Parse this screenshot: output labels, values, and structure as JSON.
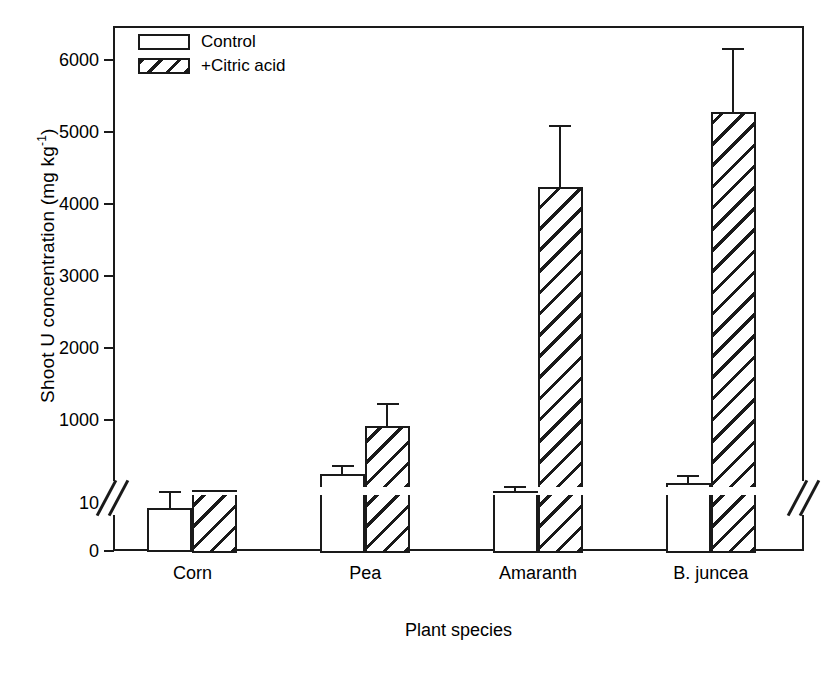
{
  "chart_data": {
    "type": "bar",
    "title": "",
    "xlabel": "Plant species",
    "ylabel": "Shoot U concentration (mg kg",
    "ylabel_sup": "-1",
    "ylabel_tail": ")",
    "categories": [
      "Corn",
      "Pea",
      "Amaranth",
      "B. juncea"
    ],
    "series": [
      {
        "name": "Control",
        "fill": "solid-white",
        "values": [
          9,
          250,
          20,
          120
        ],
        "errors": [
          3,
          130,
          60,
          110
        ]
      },
      {
        "name": "+Citric acid",
        "fill": "hatched",
        "values": [
          33,
          910,
          4230,
          5280
        ],
        "errors": [
          0,
          320,
          870,
          880
        ]
      }
    ],
    "yticks": [
      0,
      10,
      1000,
      2000,
      3000,
      4000,
      5000,
      6000
    ],
    "ytick_labels": [
      "0",
      "10",
      "1000",
      "2000",
      "3000",
      "4000",
      "5000",
      "6000"
    ],
    "ylim_lower": [
      0,
      10
    ],
    "ylim_upper": [
      1000,
      6300
    ],
    "axis_break": true,
    "axis_break_note": "broken y-axis between 10 and 1000",
    "grid": false,
    "legend_position": "top-left",
    "accent_color": "#1a1a1a",
    "background_color": "#ffffff"
  },
  "legend": {
    "items": [
      {
        "label": "Control"
      },
      {
        "label": "+Citric acid"
      }
    ]
  },
  "icons": {
    "axis_break": "double-slash-icon"
  }
}
